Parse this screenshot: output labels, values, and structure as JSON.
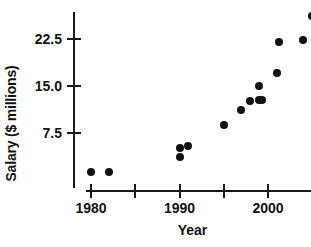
{
  "chart_data": {
    "type": "scatter",
    "title": "",
    "xlabel": "Year",
    "ylabel": "Salary ($ millions)",
    "xlim": [
      1978.5,
      2006.5
    ],
    "ylim": [
      0,
      27.5
    ],
    "grid": false,
    "legend": null,
    "xticks": [
      {
        "value": 1980,
        "label": "1980"
      },
      {
        "value": 1985,
        "label": ""
      },
      {
        "value": 1990,
        "label": "1990"
      },
      {
        "value": 1995,
        "label": ""
      },
      {
        "value": 2000,
        "label": "2000"
      },
      {
        "value": 2005,
        "label": ""
      }
    ],
    "yticks": [
      {
        "value": 7.5,
        "label": "7.5"
      },
      {
        "value": 15.0,
        "label": "15.0"
      },
      {
        "value": 22.5,
        "label": "22.5"
      }
    ],
    "points": [
      {
        "x": 1980,
        "y": 1.3
      },
      {
        "x": 1982,
        "y": 1.3
      },
      {
        "x": 1990,
        "y": 3.7
      },
      {
        "x": 1990,
        "y": 5.1
      },
      {
        "x": 1991,
        "y": 5.4
      },
      {
        "x": 1995,
        "y": 8.8
      },
      {
        "x": 1997,
        "y": 11.2
      },
      {
        "x": 1998,
        "y": 12.6
      },
      {
        "x": 1999,
        "y": 12.8
      },
      {
        "x": 1999.3,
        "y": 12.8
      },
      {
        "x": 1999,
        "y": 15.0
      },
      {
        "x": 2001,
        "y": 17.1
      },
      {
        "x": 2001.2,
        "y": 22.1
      },
      {
        "x": 2004,
        "y": 22.4
      },
      {
        "x": 2005,
        "y": 26.1
      }
    ],
    "colors": {
      "marker": "#111111",
      "axis": "#1a1a1a",
      "background": "#ffffff",
      "text": "#111111"
    }
  }
}
